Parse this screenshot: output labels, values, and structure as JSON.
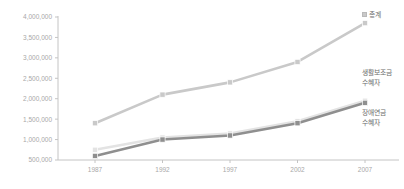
{
  "chart_data": {
    "type": "line",
    "title": "",
    "subtitle": "",
    "xlabel": "",
    "ylabel": "",
    "categories": [
      "1987",
      "1992",
      "1997",
      "2002",
      "2007"
    ],
    "x": [
      1987,
      1992,
      1997,
      2002,
      2007
    ],
    "ylim": [
      500000,
      4000000
    ],
    "yticks": [
      500000,
      1000000,
      1500000,
      2000000,
      2500000,
      3000000,
      3500000,
      4000000
    ],
    "ytick_labels": [
      "500,000",
      "1,000,000",
      "1,500,000",
      "2,000,000",
      "2,500,000",
      "3,000,000",
      "3,500,000",
      "4,000,000"
    ],
    "xtick_labels": [
      "1987",
      "1992",
      "1997",
      "2002",
      "2007"
    ],
    "grid": false,
    "legend_position": "right-inline",
    "series": [
      {
        "name": "총계",
        "label_lines": [
          "총계"
        ],
        "color": "#c9c9c9",
        "marker": "square",
        "values": [
          1400000,
          2100000,
          2400000,
          2900000,
          3850000
        ]
      },
      {
        "name": "생활보조금 수혜자",
        "label_lines": [
          "생활보조금",
          "수혜자"
        ],
        "color": "#e3e3e3",
        "marker": "square",
        "values": [
          750000,
          1050000,
          1150000,
          1450000,
          1950000
        ]
      },
      {
        "name": "장애연금 수혜자",
        "label_lines": [
          "장애연금",
          "수혜자"
        ],
        "color": "#8f8f8f",
        "marker": "square",
        "values": [
          600000,
          1000000,
          1100000,
          1400000,
          1900000
        ]
      }
    ]
  },
  "colors": {
    "axis": "#c4c4c4",
    "tick_text": "#a8a8a8",
    "label_text": "#6d6d6d",
    "background": "#ffffff"
  }
}
